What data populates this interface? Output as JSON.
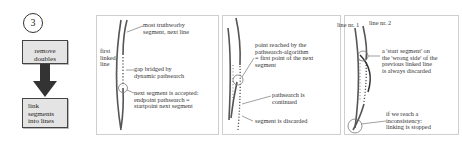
{
  "flowchart": {
    "step_number": "3",
    "box1": "remove doubles",
    "box2_lines": [
      "link",
      "segments",
      "into lines"
    ],
    "arrow": "down-arrow"
  },
  "panel1": {
    "label_first_line": [
      "first",
      "linked",
      "line"
    ],
    "label_trustworthy": [
      "most truthworby",
      "segment, next line"
    ],
    "label_gap": [
      "gap bridged by",
      "dynamic pathsearch"
    ],
    "label_next": [
      "next segment is accepted:",
      "endpoint pathsearch =",
      "startpoint next segment"
    ]
  },
  "panel2": {
    "label_point": [
      "point reached by the",
      "pathsearch-algorithm",
      "= first point of the next",
      "segment"
    ],
    "label_continued": [
      "pathsearch is",
      "continued"
    ],
    "label_discarded": [
      "segment is discarded"
    ]
  },
  "panel3": {
    "label_line1": "line nr. 1",
    "label_line2": "line nr. 2",
    "label_start": [
      "a 'start segment' on",
      "the 'wrong side' of the",
      "previous linked line",
      "is always discarded"
    ],
    "label_inconsistency": [
      "if we reach a",
      "inconsistency:",
      "linking is stopped"
    ]
  }
}
